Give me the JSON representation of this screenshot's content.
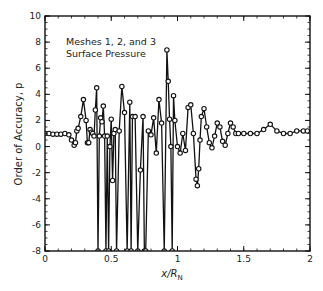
{
  "chart_data": {
    "type": "line",
    "title": "",
    "annotation": [
      "Meshes 1, 2, and 3",
      "Surface Pressure"
    ],
    "xlabel": "x/R",
    "xlabel_subscript": "N",
    "ylabel": "Order of Accuracy, p",
    "xlim": [
      0,
      2
    ],
    "ylim": [
      -8,
      10
    ],
    "xticks": [
      0,
      0.5,
      1,
      1.5,
      2
    ],
    "xtick_labels": [
      "0",
      "0.5",
      "1",
      "1.5",
      "2"
    ],
    "yticks": [
      -8,
      -6,
      -4,
      -2,
      0,
      2,
      4,
      6,
      8,
      10
    ],
    "ytick_labels": [
      "-8",
      "-6",
      "-4",
      "-2",
      "0",
      "2",
      "4",
      "6",
      "8",
      "10"
    ],
    "grid": false,
    "legend": null,
    "series": [
      {
        "name": "Surface Pressure order of accuracy",
        "marker": "circle",
        "color": "#111111",
        "x": [
          0.0,
          0.03,
          0.06,
          0.09,
          0.12,
          0.15,
          0.18,
          0.2,
          0.22,
          0.23,
          0.24,
          0.25,
          0.27,
          0.29,
          0.31,
          0.32,
          0.33,
          0.34,
          0.35,
          0.36,
          0.37,
          0.38,
          0.39,
          0.4,
          0.41,
          0.42,
          0.43,
          0.44,
          0.45,
          0.46,
          0.47,
          0.48,
          0.49,
          0.5,
          0.51,
          0.52,
          0.53,
          0.54,
          0.56,
          0.58,
          0.6,
          0.62,
          0.64,
          0.65,
          0.66,
          0.68,
          0.7,
          0.72,
          0.74,
          0.75,
          0.76,
          0.78,
          0.8,
          0.82,
          0.84,
          0.86,
          0.88,
          0.9,
          0.92,
          0.93,
          0.94,
          0.95,
          0.96,
          0.97,
          0.98,
          1.0,
          1.02,
          1.04,
          1.06,
          1.08,
          1.1,
          1.12,
          1.14,
          1.15,
          1.16,
          1.17,
          1.18,
          1.2,
          1.22,
          1.24,
          1.26,
          1.28,
          1.3,
          1.32,
          1.34,
          1.36,
          1.38,
          1.4,
          1.42,
          1.44,
          1.46,
          1.5,
          1.55,
          1.6,
          1.65,
          1.7,
          1.75,
          1.8,
          1.85,
          1.9,
          1.95,
          1.98
        ],
        "y": [
          1.0,
          1.0,
          0.95,
          0.95,
          0.95,
          1.0,
          0.9,
          0.5,
          0.1,
          0.3,
          1.2,
          1.4,
          2.3,
          3.6,
          2.0,
          0.3,
          0.3,
          1.3,
          1.1,
          1.0,
          0.8,
          2.8,
          4.5,
          -8,
          0.8,
          2.2,
          1.9,
          3.1,
          0.8,
          -8,
          0.8,
          -8,
          0.0,
          2.1,
          -2.6,
          1.0,
          1.3,
          -8,
          1.2,
          4.6,
          2.6,
          -8,
          3.4,
          -8,
          2.3,
          2.3,
          -8,
          -1.8,
          2.3,
          -8,
          -8,
          1.2,
          0.9,
          2.2,
          -0.5,
          3.6,
          1.8,
          -8,
          7.4,
          5.0,
          2.1,
          0.0,
          -8,
          3.9,
          2.0,
          0.0,
          -0.5,
          1.0,
          -0.3,
          3.0,
          3.2,
          1.0,
          -2.5,
          -3.0,
          -1.7,
          0.5,
          2.3,
          2.9,
          1.5,
          0.3,
          -0.1,
          0.8,
          1.8,
          1.5,
          0.4,
          0.1,
          1.0,
          1.8,
          1.5,
          1.0,
          1.0,
          1.0,
          1.0,
          1.0,
          1.3,
          1.7,
          1.2,
          1.0,
          1.0,
          1.2,
          1.2,
          1.2
        ]
      }
    ]
  }
}
